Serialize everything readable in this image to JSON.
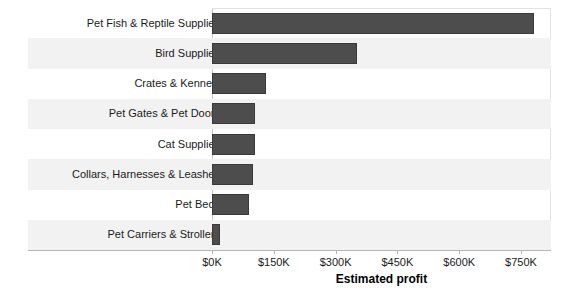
{
  "chart_data": {
    "type": "bar",
    "orientation": "horizontal",
    "title": "",
    "xlabel": "Estimated profit",
    "ylabel": "",
    "categories": [
      "Pet Fish & Reptile Supplies",
      "Bird Supplies",
      "Crates & Kennels",
      "Pet Gates & Pet Doors",
      "Cat Supplies",
      "Collars, Harnesses & Leashes",
      "Pet Beds",
      "Pet Carriers & Strollers"
    ],
    "values": [
      782000,
      352000,
      131000,
      104000,
      104000,
      99000,
      90000,
      20000
    ],
    "value_unit": "USD",
    "xlim": [
      0,
      822000
    ],
    "xticks": [
      0,
      150000,
      300000,
      450000,
      600000,
      750000
    ],
    "xtick_labels": [
      "$0K",
      "$150K",
      "$300K",
      "$450K",
      "$600K",
      "$750K"
    ],
    "grid": false,
    "legend": "none",
    "bar_color": "#4d4d4d",
    "band_color": "#f2f2f2",
    "background": "#ffffff"
  },
  "axis": {
    "x_title": "Estimated profit"
  }
}
